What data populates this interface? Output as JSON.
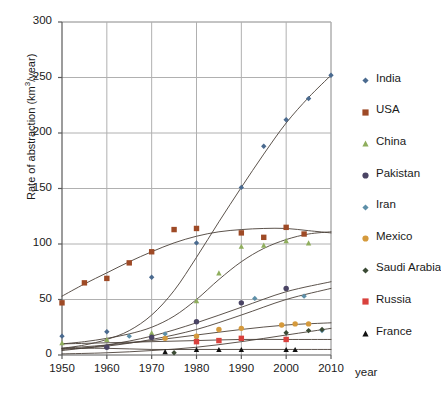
{
  "chart_data": {
    "type": "scatter",
    "title": "",
    "xlabel": "year",
    "ylabel": "Rate of abstraction (km3/year)",
    "ylabel_prefix": "Rate of abstraction (km",
    "ylabel_sup": "3",
    "ylabel_suffix": "/year)",
    "xlim": [
      1950,
      2010
    ],
    "ylim": [
      0,
      300
    ],
    "yticks": [
      0,
      50,
      100,
      150,
      200,
      250,
      300
    ],
    "xticks": [
      1950,
      1960,
      1970,
      1980,
      1990,
      2000,
      2010
    ],
    "grid": true,
    "legend_position": "right",
    "series": [
      {
        "name": "India",
        "color": "#4a6a8f",
        "marker": "diamond",
        "points": [
          [
            1950,
            17
          ],
          [
            1960,
            21
          ],
          [
            1970,
            70
          ],
          [
            1980,
            101
          ],
          [
            1990,
            151
          ],
          [
            1995,
            188
          ],
          [
            2000,
            212
          ],
          [
            2005,
            231
          ],
          [
            2010,
            252
          ]
        ],
        "trend": [
          [
            1950,
            6
          ],
          [
            1955,
            9
          ],
          [
            1960,
            14
          ],
          [
            1965,
            22
          ],
          [
            1970,
            36
          ],
          [
            1975,
            58
          ],
          [
            1980,
            88
          ],
          [
            1985,
            120
          ],
          [
            1990,
            151
          ],
          [
            1995,
            181
          ],
          [
            2000,
            209
          ],
          [
            2005,
            232
          ],
          [
            2010,
            252
          ]
        ]
      },
      {
        "name": "USA",
        "color": "#9e4a26",
        "marker": "square",
        "points": [
          [
            1950,
            47
          ],
          [
            1955,
            65
          ],
          [
            1960,
            69
          ],
          [
            1965,
            83
          ],
          [
            1970,
            93
          ],
          [
            1975,
            113
          ],
          [
            1980,
            114
          ],
          [
            1990,
            110
          ],
          [
            1995,
            106
          ],
          [
            2000,
            115
          ],
          [
            2004,
            109
          ]
        ],
        "trend": [
          [
            1950,
            53
          ],
          [
            1955,
            64
          ],
          [
            1960,
            74
          ],
          [
            1965,
            84
          ],
          [
            1970,
            93
          ],
          [
            1975,
            101
          ],
          [
            1980,
            107
          ],
          [
            1985,
            111
          ],
          [
            1990,
            113
          ],
          [
            1995,
            114
          ],
          [
            2000,
            114
          ],
          [
            2005,
            112
          ],
          [
            2010,
            110
          ]
        ]
      },
      {
        "name": "China",
        "color": "#8fae5d",
        "marker": "triangle",
        "points": [
          [
            1950,
            11
          ],
          [
            1960,
            14
          ],
          [
            1970,
            20
          ],
          [
            1980,
            49
          ],
          [
            1985,
            74
          ],
          [
            1990,
            98
          ],
          [
            1995,
            99
          ],
          [
            2000,
            103
          ],
          [
            2005,
            101
          ]
        ],
        "trend": [
          [
            1950,
            10
          ],
          [
            1955,
            12
          ],
          [
            1960,
            15
          ],
          [
            1965,
            19
          ],
          [
            1970,
            25
          ],
          [
            1975,
            35
          ],
          [
            1980,
            50
          ],
          [
            1985,
            68
          ],
          [
            1990,
            84
          ],
          [
            1995,
            96
          ],
          [
            2000,
            104
          ],
          [
            2005,
            109
          ],
          [
            2010,
            111
          ]
        ]
      },
      {
        "name": "Pakistan",
        "color": "#4a4464",
        "marker": "circle",
        "points": [
          [
            1960,
            7
          ],
          [
            1970,
            16
          ],
          [
            1980,
            30
          ],
          [
            1990,
            47
          ],
          [
            2000,
            60
          ]
        ],
        "trend": [
          [
            1950,
            4
          ],
          [
            1960,
            9
          ],
          [
            1970,
            17
          ],
          [
            1980,
            29
          ],
          [
            1990,
            43
          ],
          [
            2000,
            57
          ],
          [
            2010,
            66
          ]
        ]
      },
      {
        "name": "Iran",
        "color": "#5d8fa8",
        "marker": "diamond",
        "points": [
          [
            1965,
            17
          ],
          [
            1973,
            19
          ],
          [
            1980,
            14
          ],
          [
            1993,
            51
          ],
          [
            2004,
            53
          ],
          [
            2008,
            22
          ]
        ],
        "trend": [
          [
            1950,
            5
          ],
          [
            1960,
            8
          ],
          [
            1970,
            14
          ],
          [
            1980,
            23
          ],
          [
            1990,
            36
          ],
          [
            2000,
            50
          ],
          [
            2010,
            60
          ]
        ]
      },
      {
        "name": "Mexico",
        "color": "#d59a3c",
        "marker": "circle",
        "points": [
          [
            1973,
            15
          ],
          [
            1980,
            17
          ],
          [
            1985,
            23
          ],
          [
            1990,
            24
          ],
          [
            1999,
            27
          ],
          [
            2002,
            28
          ],
          [
            2005,
            28
          ]
        ],
        "trend": [
          [
            1950,
            6
          ],
          [
            1960,
            9
          ],
          [
            1970,
            13
          ],
          [
            1980,
            18
          ],
          [
            1990,
            23
          ],
          [
            2000,
            27
          ],
          [
            2010,
            29
          ]
        ]
      },
      {
        "name": "Saudi Arabia",
        "color": "#3a4a34",
        "marker": "diamond",
        "points": [
          [
            1975,
            2
          ],
          [
            2000,
            20
          ],
          [
            2005,
            22
          ],
          [
            2008,
            23
          ]
        ],
        "trend": [
          [
            1950,
            1
          ],
          [
            1960,
            2
          ],
          [
            1970,
            4
          ],
          [
            1980,
            7
          ],
          [
            1990,
            12
          ],
          [
            2000,
            18
          ],
          [
            2010,
            24
          ]
        ]
      },
      {
        "name": "Russia",
        "color": "#d9413d",
        "marker": "square",
        "points": [
          [
            1980,
            12
          ],
          [
            1985,
            13
          ],
          [
            1990,
            15
          ],
          [
            2000,
            14
          ]
        ],
        "trend": [
          [
            1950,
            10
          ],
          [
            1960,
            11
          ],
          [
            1970,
            12
          ],
          [
            1980,
            13
          ],
          [
            1990,
            14
          ],
          [
            2000,
            14
          ],
          [
            2010,
            14
          ]
        ]
      },
      {
        "name": "France",
        "color": "#111111",
        "marker": "triangle",
        "points": [
          [
            1973,
            3
          ],
          [
            1980,
            5
          ],
          [
            1985,
            5
          ],
          [
            1990,
            5
          ],
          [
            2000,
            5
          ],
          [
            2002,
            5
          ]
        ],
        "trend": [
          [
            1950,
            6
          ],
          [
            1960,
            6
          ],
          [
            1970,
            5
          ],
          [
            1980,
            5
          ],
          [
            1990,
            5
          ],
          [
            2000,
            5
          ],
          [
            2010,
            5
          ]
        ]
      }
    ]
  }
}
